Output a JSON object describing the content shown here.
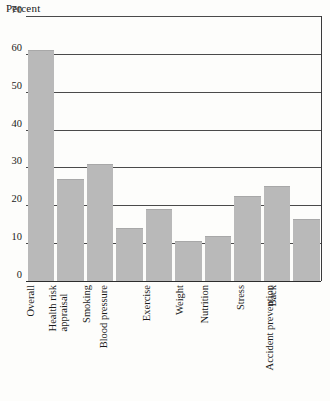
{
  "chart_data": {
    "type": "bar",
    "title": "",
    "ylabel": "Percent",
    "xlabel": "",
    "ylim": [
      0,
      70
    ],
    "yticks": [
      0,
      10,
      20,
      30,
      40,
      50,
      60,
      70
    ],
    "ytick_labels": [
      "0",
      "10",
      "20",
      "30",
      "40",
      "50",
      "60",
      "70"
    ],
    "grid": true,
    "legend": "none",
    "bar_color": "#b9b9b9",
    "categories": [
      "Overall",
      "Health risk appraisal",
      "Smoking",
      "Blood pressure",
      "Exercise",
      "Weight",
      "Nutrition",
      "Stress",
      "Back",
      "Accident prevention"
    ],
    "category_lines": [
      [
        "Overall"
      ],
      [
        "Health risk",
        "appraisal"
      ],
      [
        "Smoking"
      ],
      [
        "Blood pressure"
      ],
      [
        "Exercise"
      ],
      [
        "Weight"
      ],
      [
        "Nutrition"
      ],
      [
        "Stress"
      ],
      [
        "Back"
      ],
      [
        "Accident prevention"
      ]
    ],
    "values": [
      61,
      27,
      31,
      14,
      19,
      10.5,
      12,
      22.5,
      25,
      16.5
    ]
  }
}
